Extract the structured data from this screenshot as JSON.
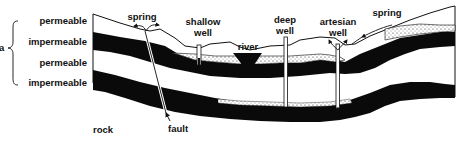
{
  "diagram": {
    "type": "geological-cross-section",
    "left_labels": [
      {
        "text": "permeable",
        "y": 20
      },
      {
        "text": "impermeable",
        "y": 40
      },
      {
        "text": "permeable",
        "y": 61
      },
      {
        "text": "impermeable",
        "y": 81
      }
    ],
    "brace_prefix": "a",
    "top_labels": {
      "spring_left": "spring",
      "shallow_well_1": "shallow",
      "shallow_well_2": "well",
      "river": "river",
      "deep_well_1": "deep",
      "deep_well_2": "well",
      "artesian_well_1": "artesian",
      "artesian_well_2": "well",
      "spring_right": "spring"
    },
    "bottom_labels": {
      "rock": "rock",
      "fault": "fault"
    },
    "colors": {
      "impermeable": "#0a0a0a",
      "permeable": "#ffffff",
      "outline": "#111111",
      "water_dots": "#222222"
    }
  }
}
